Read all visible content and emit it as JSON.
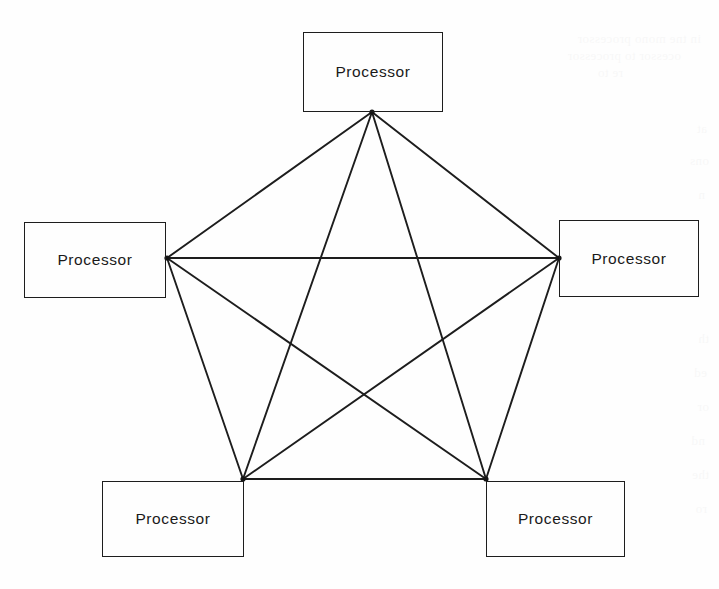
{
  "figure": {
    "background_color": "#fefefe",
    "line_color": "#1d1d1d",
    "text_color": "#1a1a1a",
    "width": 719,
    "height": 589
  },
  "nodes": [
    {
      "id": "top",
      "label": "Processor",
      "box": {
        "x": 303,
        "y": 32,
        "w": 140,
        "h": 80
      },
      "port": {
        "x": 372,
        "y": 112
      }
    },
    {
      "id": "left",
      "label": "Processor",
      "box": {
        "x": 24,
        "y": 222,
        "w": 142,
        "h": 76
      },
      "port": {
        "x": 167,
        "y": 258
      }
    },
    {
      "id": "right",
      "label": "Processor",
      "box": {
        "x": 559,
        "y": 220,
        "w": 140,
        "h": 77
      },
      "port": {
        "x": 559,
        "y": 258
      }
    },
    {
      "id": "bottom-left",
      "label": "Processor",
      "box": {
        "x": 102,
        "y": 481,
        "w": 142,
        "h": 76
      },
      "port": {
        "x": 243,
        "y": 479
      }
    },
    {
      "id": "bottom-right",
      "label": "Processor",
      "box": {
        "x": 486,
        "y": 481,
        "w": 139,
        "h": 76
      },
      "port": {
        "x": 486,
        "y": 479
      }
    }
  ],
  "edges": [
    {
      "from": "top",
      "to": "left"
    },
    {
      "from": "top",
      "to": "right"
    },
    {
      "from": "top",
      "to": "bottom-left"
    },
    {
      "from": "top",
      "to": "bottom-right"
    },
    {
      "from": "left",
      "to": "right"
    },
    {
      "from": "left",
      "to": "bottom-left"
    },
    {
      "from": "left",
      "to": "bottom-right"
    },
    {
      "from": "right",
      "to": "bottom-left"
    },
    {
      "from": "right",
      "to": "bottom-right"
    },
    {
      "from": "bottom-left",
      "to": "bottom-right"
    }
  ],
  "scan_artifacts": [
    {
      "text": "in tne mono processor",
      "x": 18,
      "y": 30
    },
    {
      "text": "ocessor to processor",
      "x": 38,
      "y": 47
    },
    {
      "text": "re to",
      "x": 96,
      "y": 64
    },
    {
      "text": "at",
      "x": 12,
      "y": 120
    },
    {
      "text": "ons",
      "x": 10,
      "y": 152
    },
    {
      "text": "n",
      "x": 14,
      "y": 186
    },
    {
      "text": "th",
      "x": 10,
      "y": 330
    },
    {
      "text": "ed",
      "x": 12,
      "y": 364
    },
    {
      "text": "or",
      "x": 10,
      "y": 398
    },
    {
      "text": "nd",
      "x": 14,
      "y": 432
    },
    {
      "text": "the",
      "x": 10,
      "y": 466
    },
    {
      "text": "ro",
      "x": 12,
      "y": 500
    }
  ]
}
